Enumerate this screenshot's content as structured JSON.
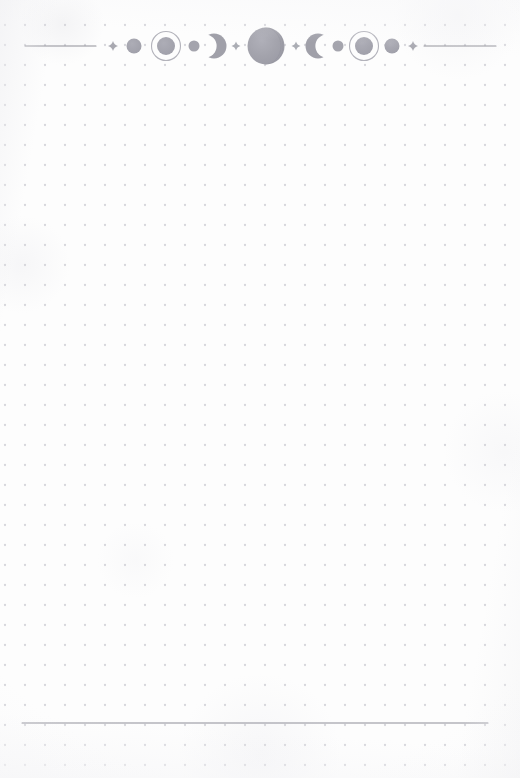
{
  "page": {
    "width": 520,
    "height": 778,
    "background_color": "#fdfdfd",
    "paper_tone": "#fbfbfc"
  },
  "dot_grid": {
    "name": "dotted-grid-background",
    "spacing_px": 20,
    "origin_x": 5,
    "origin_y": 25,
    "dot_radius_px": 1.15,
    "dot_color": "#d6d6db",
    "columns": 26,
    "rows": 38
  },
  "header": {
    "name": "celestial-lunar-phase-ornament",
    "center_y": 46,
    "ink_color": "#9a9aa2",
    "ink_color_light": "#b9b9c0",
    "ink_color_dark": "#8e8e97",
    "rule_color": "#8f8f98",
    "left_rule": {
      "x1": 25,
      "x2": 96,
      "y": 46
    },
    "right_rule": {
      "x1": 424,
      "x2": 496,
      "y": 46
    },
    "elements": [
      {
        "type": "sparkle",
        "name": "sparkle-left-outer",
        "cx": 113,
        "size": 5.0,
        "color": "#a9a9b1"
      },
      {
        "type": "circle",
        "name": "circle-small-left",
        "cx": 134,
        "r": 7.5,
        "color": "#a2a2ab"
      },
      {
        "type": "ringed-circle",
        "name": "ringed-circle-left",
        "cx": 166,
        "r": 9.0,
        "ring_r": 14.5,
        "color": "#9d9da6",
        "ring_color": "#b3b3bb"
      },
      {
        "type": "dot",
        "name": "dot-before-crescent",
        "cx": 194,
        "r": 5.5,
        "color": "#a4a4ad"
      },
      {
        "type": "crescent",
        "name": "crescent-waxing",
        "cx": 214,
        "r": 12.5,
        "facing": "right",
        "color": "#a0a0a9"
      },
      {
        "type": "sparkle",
        "name": "sparkle-left-inner",
        "cx": 236,
        "size": 4.5,
        "color": "#abadb4"
      },
      {
        "type": "sphere",
        "name": "full-moon-center",
        "cx": 266,
        "r": 18.5,
        "color": "#a1a1aa"
      },
      {
        "type": "sparkle",
        "name": "sparkle-right-inner",
        "cx": 296,
        "size": 4.5,
        "color": "#abadb4"
      },
      {
        "type": "crescent",
        "name": "crescent-waning",
        "cx": 318,
        "r": 12.5,
        "facing": "left",
        "color": "#a0a0a9"
      },
      {
        "type": "dot",
        "name": "dot-after-crescent",
        "cx": 338,
        "r": 5.5,
        "color": "#a4a4ad"
      },
      {
        "type": "ringed-circle",
        "name": "ringed-circle-right",
        "cx": 364,
        "r": 9.0,
        "ring_r": 14.5,
        "color": "#9d9da6",
        "ring_color": "#b3b3bb"
      },
      {
        "type": "circle",
        "name": "circle-small-right",
        "cx": 392,
        "r": 7.5,
        "color": "#a2a2ab"
      },
      {
        "type": "sparkle",
        "name": "sparkle-right-outer",
        "cx": 413,
        "size": 5.0,
        "color": "#a9a9b1"
      }
    ]
  },
  "footer": {
    "name": "footer-divider-rule",
    "y": 723,
    "x1": 22,
    "x2": 488,
    "thickness_px": 1,
    "color": "#8e8e97"
  },
  "content": {
    "name": "writing-area",
    "text": ""
  }
}
